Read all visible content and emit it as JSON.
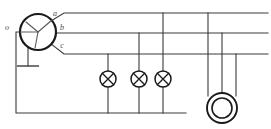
{
  "diagram": {
    "labels": {
      "neutral": "o",
      "phase_a": "a",
      "phase_b": "b",
      "phase_c": "c"
    },
    "components": {
      "generator_name": "three-phase alternator",
      "lamp_name": "lamp",
      "motor_name": "three-phase motor",
      "ground_name": "earth ground"
    },
    "colors": {
      "wire": "#3a3a3a",
      "outline": "#1a1a1a",
      "winding": "#5a5a5a",
      "background": "#ffffff",
      "label": "#4a4a4a"
    },
    "geometry": {
      "width": 271,
      "height": 129,
      "generator": {
        "cx": 38,
        "cy": 32,
        "r": 18
      },
      "bus_y": {
        "a": 13,
        "b": 33,
        "c": 54
      },
      "bus_right_x": 268,
      "neutral": {
        "x": 16,
        "y_top": 32,
        "y_bottom": 113,
        "x_right": 186
      },
      "ground": {
        "x": 28,
        "y_top": 42,
        "y_bar": 66,
        "half_width": 11
      },
      "lamps": [
        {
          "x": 108,
          "y": 79,
          "r": 8,
          "bus": "c"
        },
        {
          "x": 139,
          "y": 79,
          "r": 8,
          "bus": "b"
        },
        {
          "x": 163,
          "y": 79,
          "r": 8,
          "bus": "a"
        }
      ],
      "motor": {
        "cx": 222,
        "cy": 108,
        "r_outer": 15,
        "r_inner": 10
      },
      "motor_taps": [
        {
          "x": 208,
          "bus": "a"
        },
        {
          "x": 222,
          "bus": "b"
        },
        {
          "x": 236,
          "bus": "c"
        }
      ]
    }
  }
}
